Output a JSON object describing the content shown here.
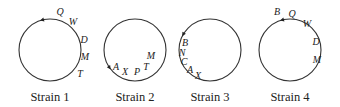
{
  "diagram": {
    "type": "circular gene maps",
    "strains": [
      {
        "caption": "Strain 1",
        "center": [
          50,
          50
        ],
        "radius": 31,
        "arrow": {
          "angle": 105,
          "direction": "counterclockwise"
        },
        "genes": [
          {
            "label": "Q",
            "x": 60,
            "y": 15
          },
          {
            "label": "W",
            "x": 73,
            "y": 25
          },
          {
            "label": "D",
            "x": 84,
            "y": 43
          },
          {
            "label": "M",
            "x": 85,
            "y": 60
          },
          {
            "label": "T",
            "x": 80,
            "y": 77
          }
        ]
      },
      {
        "caption": "Strain 2",
        "center": [
          135,
          50
        ],
        "radius": 31,
        "arrow": {
          "angle": 215,
          "direction": "counterclockwise"
        },
        "genes": [
          {
            "label": "A",
            "x": 116,
            "y": 70
          },
          {
            "label": "X",
            "x": 125,
            "y": 75
          },
          {
            "label": "P",
            "x": 137,
            "y": 75
          },
          {
            "label": "T",
            "x": 146,
            "y": 70
          },
          {
            "label": "M",
            "x": 151,
            "y": 59
          }
        ]
      },
      {
        "caption": "Strain 3",
        "center": [
          210,
          50
        ],
        "radius": 31,
        "arrow": {
          "angle": 150,
          "direction": "counterclockwise"
        },
        "genes": [
          {
            "label": "B",
            "x": 185,
            "y": 46
          },
          {
            "label": "N",
            "x": 182,
            "y": 56
          },
          {
            "label": "C",
            "x": 184,
            "y": 65
          },
          {
            "label": "A",
            "x": 190,
            "y": 73
          },
          {
            "label": "X",
            "x": 198,
            "y": 79
          }
        ]
      },
      {
        "caption": "Strain 4",
        "center": [
          290,
          50
        ],
        "radius": 31,
        "arrow": {
          "angle": 105,
          "direction": "counterclockwise"
        },
        "genes": [
          {
            "label": "B",
            "x": 277,
            "y": 15
          },
          {
            "label": "Q",
            "x": 292,
            "y": 17
          },
          {
            "label": "W",
            "x": 307,
            "y": 27
          },
          {
            "label": "D",
            "x": 316,
            "y": 45
          },
          {
            "label": "M",
            "x": 317,
            "y": 63
          }
        ]
      }
    ]
  }
}
